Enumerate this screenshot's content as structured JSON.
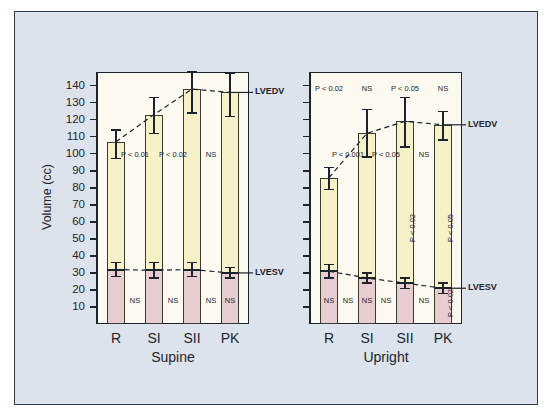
{
  "chart_data": {
    "type": "bar",
    "title": "",
    "xlabel": "",
    "ylabel": "Volume (cc)",
    "ylim": [
      0,
      148
    ],
    "yticks": [
      10,
      20,
      30,
      40,
      50,
      60,
      70,
      80,
      90,
      100,
      110,
      120,
      130,
      140
    ],
    "ytick_labels": [
      "10",
      "20",
      "30",
      "40",
      "50",
      "60",
      "70",
      "80",
      "90",
      "100",
      "110",
      "120",
      "130",
      "140"
    ],
    "grid": false,
    "legend_position": "right-edge-inline",
    "categories": [
      "R",
      "SI",
      "SII",
      "PK"
    ],
    "panels": [
      {
        "name": "supine",
        "label": "Supine",
        "y_axis_labeled": true,
        "series": [
          {
            "name": "LVEDV",
            "edge_label": "LVEDV",
            "color": "#f6f1c8",
            "values": [
              107,
              123,
              138,
              136
            ],
            "err_upper": [
              114,
              133,
              148,
              147
            ],
            "err_lower": [
              97,
              112,
              124,
              122
            ]
          },
          {
            "name": "LVESV",
            "edge_label": "LVESV",
            "color": "#e8cdd0",
            "values": [
              32,
              31.5,
              32,
              30
            ],
            "err_upper": [
              36,
              36,
              36,
              33
            ],
            "err_lower": [
              28,
              27,
              28,
              27
            ]
          }
        ],
        "annotations_upper": [
          {
            "text": "P < 0.01",
            "between": [
              0,
              1
            ]
          },
          {
            "text": "P < 0.02",
            "between": [
              1,
              2
            ]
          },
          {
            "text": "NS",
            "between": [
              2,
              3
            ]
          }
        ],
        "annotations_lower": [
          {
            "text": "NS",
            "between": [
              0,
              1
            ]
          },
          {
            "text": "NS",
            "between": [
              1,
              2
            ]
          },
          {
            "text": "NS",
            "between": [
              2,
              3
            ]
          }
        ],
        "annotations_in_bar": [
          {
            "text": "NS",
            "bar": 3,
            "orientation": "horizontal"
          }
        ],
        "annotations_top": []
      },
      {
        "name": "upright",
        "label": "Upright",
        "y_axis_labeled": false,
        "series": [
          {
            "name": "LVEDV",
            "edge_label": "LVEDV",
            "color": "#f6f1c8",
            "values": [
              86,
              112,
              119,
              117
            ],
            "err_upper": [
              92,
              126,
              133,
              125
            ],
            "err_lower": [
              79,
              98,
              104,
              108
            ]
          },
          {
            "name": "LVESV",
            "edge_label": "LVESV",
            "color": "#e8cdd0",
            "values": [
              31,
              27,
              24,
              21
            ],
            "err_upper": [
              35,
              30,
              27,
              24
            ],
            "err_lower": [
              27,
              24,
              21,
              18
            ]
          }
        ],
        "annotations_upper": [
          {
            "text": "P < 0.001",
            "between": [
              0,
              1
            ]
          },
          {
            "text": "P < 0.05",
            "between": [
              1,
              2
            ]
          },
          {
            "text": "NS",
            "between": [
              2,
              3
            ]
          }
        ],
        "annotations_lower": [
          {
            "text": "NS",
            "between": [
              0,
              1
            ]
          },
          {
            "text": "NS",
            "between": [
              1,
              2
            ]
          },
          {
            "text": "NS",
            "between": [
              2,
              3
            ]
          }
        ],
        "annotations_in_bar": [
          {
            "text": "NS",
            "bar": 0,
            "orientation": "horizontal"
          },
          {
            "text": "NS",
            "bar": 1,
            "orientation": "horizontal"
          },
          {
            "text": "P < 0.02",
            "bar": 2,
            "orientation": "vertical"
          },
          {
            "text": "P < 0.05",
            "bar": 3,
            "orientation": "vertical"
          },
          {
            "text": "P < 0.02",
            "bar": 3,
            "orientation": "vertical-lower"
          }
        ],
        "annotations_top": [
          {
            "text": "P < 0.02",
            "bar": 0
          },
          {
            "text": "NS",
            "bar": 1
          },
          {
            "text": "P < 0.05",
            "bar": 2
          },
          {
            "text": "NS",
            "bar": 3
          }
        ]
      }
    ]
  }
}
